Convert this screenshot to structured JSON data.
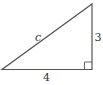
{
  "diagram": {
    "type": "right-triangle",
    "labels": {
      "hypotenuse": "c",
      "vertical_leg": "3",
      "horizontal_leg": "4"
    },
    "right_angle_corner": "bottom-right",
    "stroke_color": "#555555",
    "label_color": "#333333"
  }
}
